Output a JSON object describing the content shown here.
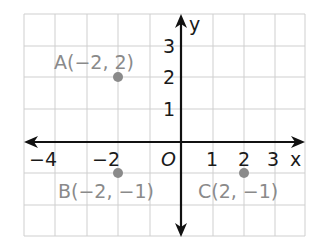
{
  "diagram": {
    "type": "coordinate-plane",
    "x_axis": {
      "label": "x",
      "ticks": [
        {
          "value": -4,
          "text": "−4"
        },
        {
          "value": -2,
          "text": "−2"
        },
        {
          "value": 1,
          "text": "1"
        },
        {
          "value": 2,
          "text": "2"
        },
        {
          "value": 3,
          "text": "3"
        }
      ]
    },
    "y_axis": {
      "label": "y",
      "ticks": [
        {
          "value": 1,
          "text": "1"
        },
        {
          "value": 2,
          "text": "2"
        },
        {
          "value": 3,
          "text": "3"
        }
      ]
    },
    "origin_label": "O",
    "points": [
      {
        "name": "A",
        "x": -2,
        "y": 2,
        "label": "A(−2, 2)"
      },
      {
        "name": "B",
        "x": -2,
        "y": -1,
        "label": "B(−2, −1)"
      },
      {
        "name": "C",
        "x": 2,
        "y": -1,
        "label": "C(2, −1)"
      }
    ],
    "colors": {
      "grid": "#c8c8c8",
      "axis": "#111111",
      "point": "#8a8a8a",
      "label": "#8a8a8a"
    }
  }
}
